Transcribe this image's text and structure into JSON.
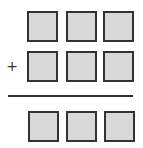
{
  "diagram": {
    "type": "vertical-addition-template",
    "operator": "+",
    "colors": {
      "box_fill": "#d8d8d8",
      "box_border": "#333333",
      "rule": "#333333",
      "background": "#ffffff"
    },
    "rows": [
      {
        "role": "addend-1",
        "boxes": [
          "",
          "",
          ""
        ]
      },
      {
        "role": "addend-2",
        "boxes": [
          "",
          "",
          ""
        ]
      },
      {
        "role": "sum",
        "boxes": [
          "",
          "",
          ""
        ]
      }
    ]
  }
}
